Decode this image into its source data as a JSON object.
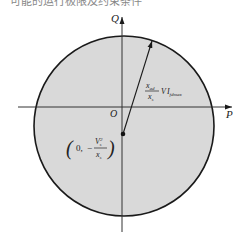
{
  "figure": {
    "top_text_fragment": "可能的运行极限及约束条件",
    "axes": {
      "x_label": "P",
      "y_label": "Q",
      "origin_label": "O"
    },
    "circle": {
      "fill": "#d9d9d9",
      "stroke": "#1a1a1a",
      "center_px": [
        124,
        126
      ],
      "radius_px": 90
    },
    "center_point": {
      "label_open": "(",
      "label_x": "0,",
      "label_sign": "−",
      "label_num": "V",
      "label_num_sup": "2",
      "label_num_sub": "s",
      "label_den": "x",
      "label_den_sub": "s",
      "label_close": ")"
    },
    "radius_vector": {
      "label_num": "x",
      "label_num_sub": "ad",
      "label_den": "x",
      "label_den_sub": "s",
      "label_tail": "V",
      "label_tail_sub": "s",
      "label_I": "I",
      "label_I_sub": "fdmax"
    }
  }
}
